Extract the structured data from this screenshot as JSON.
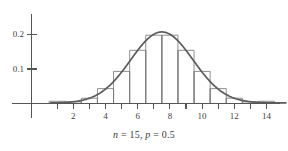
{
  "chart_data": {
    "type": "bar",
    "title": "",
    "subtitle": "",
    "caption": "n = 15, p = 0.5",
    "xlabel": "",
    "ylabel": "",
    "xlim": [
      0,
      15.4
    ],
    "ylim": [
      0,
      0.235
    ],
    "grid": false,
    "legend": "none",
    "x_ticks": [
      2,
      4,
      6,
      8,
      10,
      12,
      14
    ],
    "x_tick_labels": [
      "2",
      "4",
      "6",
      "8",
      "10",
      "12",
      "14"
    ],
    "x_minor_ticks": [
      1,
      3,
      5,
      7,
      9,
      11,
      13
    ],
    "y_ticks": [
      0.1,
      0.2
    ],
    "y_tick_labels": [
      "0.1",
      "0.2"
    ],
    "categories": [
      1,
      2,
      3,
      4,
      5,
      6,
      7,
      8,
      9,
      10,
      11,
      12,
      13,
      14
    ],
    "values": [
      0.005,
      0.0032,
      0.0139,
      0.0417,
      0.0916,
      0.1527,
      0.1964,
      0.1964,
      0.1527,
      0.0916,
      0.0417,
      0.0139,
      0.0032,
      0.005
    ],
    "bar_width": 1,
    "series": [
      {
        "name": "Binomial pmf histogram",
        "type": "bar",
        "values": [
          0.005,
          0.0032,
          0.0139,
          0.0417,
          0.0916,
          0.1527,
          0.1964,
          0.1964,
          0.1527,
          0.0916,
          0.0417,
          0.0139,
          0.0032,
          0.005
        ]
      },
      {
        "name": "Normal approximation curve",
        "type": "line",
        "mean": 7.5,
        "sd": 1.9365,
        "peak": 0.206
      }
    ]
  },
  "axes": {
    "y_axis_name": "probability-axis",
    "x_axis_name": "value-axis"
  },
  "caption": {
    "n_label": "n",
    "n_eq": " = 15, ",
    "p_label": "p",
    "p_eq": " = 0.5",
    "full": "n = 15, p = 0.5"
  }
}
